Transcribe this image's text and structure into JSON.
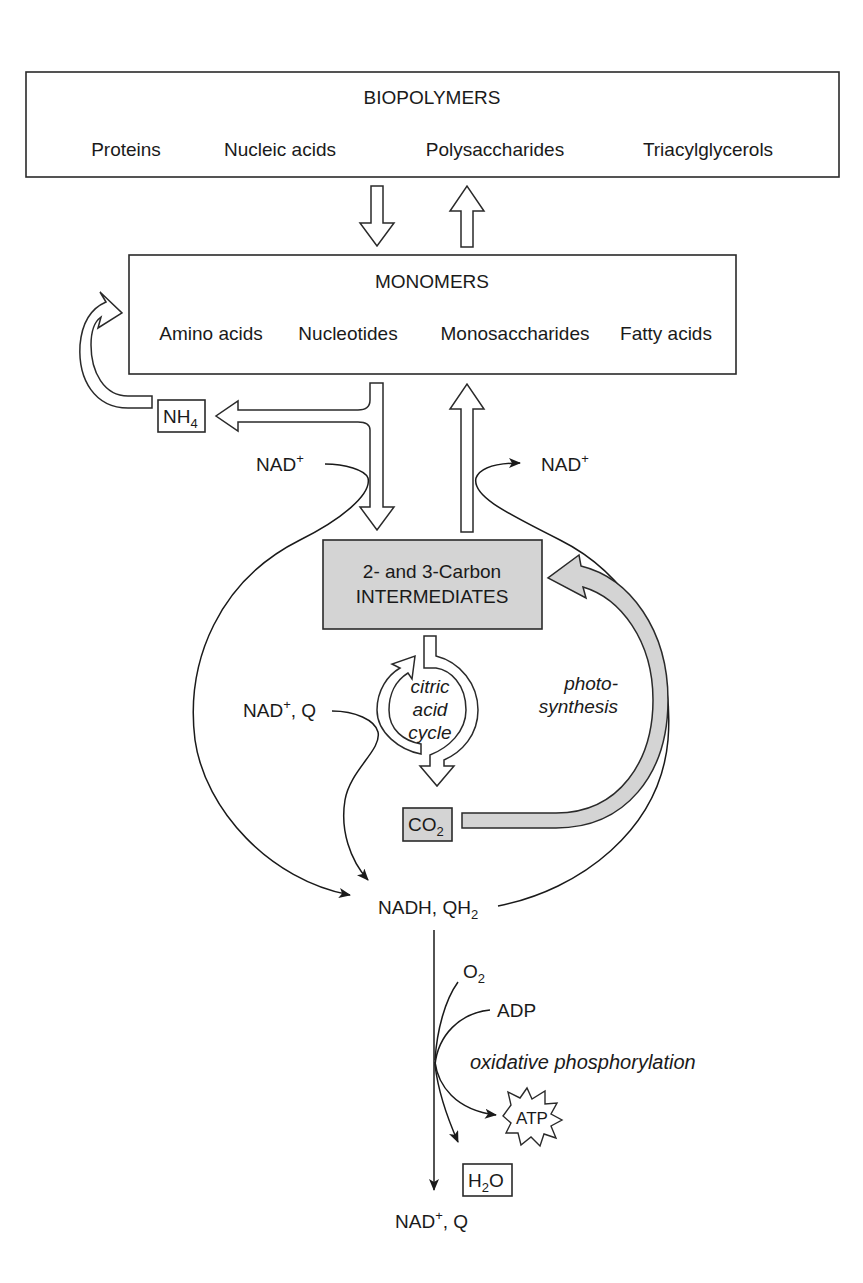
{
  "biopolymers": {
    "title": "BIOPOLYMERS",
    "items": [
      "Proteins",
      "Nucleic acids",
      "Polysaccharides",
      "Triacylglycerols"
    ]
  },
  "monomers": {
    "title": "MONOMERS",
    "items": [
      "Amino acids",
      "Nucleotides",
      "Monosaccharides",
      "Fatty acids"
    ]
  },
  "nh4": {
    "main": "NH",
    "sub": "4"
  },
  "nad_left": {
    "main": "NAD",
    "sup": "+"
  },
  "nad_right": {
    "main": "NAD",
    "sup": "+"
  },
  "intermediates": {
    "line1": "2- and 3-Carbon",
    "line2": "INTERMEDIATES"
  },
  "citric_cycle": {
    "line1": "citric",
    "line2": "acid",
    "line3": "cycle"
  },
  "nadq_in": {
    "main": "NAD",
    "sup": "+",
    "rest": ", Q"
  },
  "photosynthesis": {
    "line1": "photo-",
    "line2": "synthesis"
  },
  "co2": {
    "main": "CO",
    "sub": "2"
  },
  "nadh": {
    "main": "NADH, QH",
    "sub": "2"
  },
  "o2": {
    "main": "O",
    "sub": "2"
  },
  "adp": "ADP",
  "oxphos": "oxidative phosphorylation",
  "atp": "ATP",
  "h2o": {
    "pre": "H",
    "sub": "2",
    "post": "O"
  },
  "nadq_out": {
    "main": "NAD",
    "sup": "+",
    "rest": ", Q"
  },
  "colors": {
    "grey_fill": "#d4d4d4",
    "stroke": "#2a2a2a"
  }
}
